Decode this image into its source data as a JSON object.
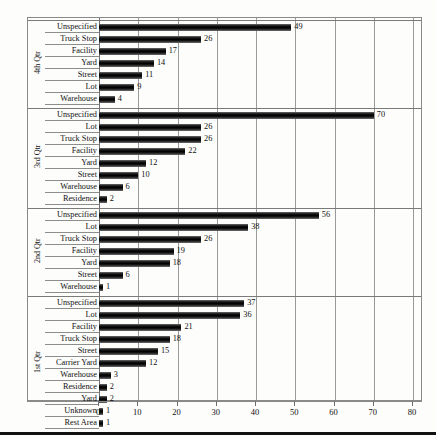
{
  "chart_data": {
    "type": "bar",
    "orientation": "horizontal",
    "title": "",
    "subtitle": "",
    "xlabel": "",
    "ylabel": "",
    "xlim": [
      0,
      80
    ],
    "xticks": [
      0,
      10,
      20,
      30,
      40,
      50,
      60,
      70,
      80
    ],
    "xtick_labels": [
      "0",
      "10",
      "20",
      "30",
      "40",
      "50",
      "60",
      "70",
      "80"
    ],
    "grid": true,
    "grid_axis": "x",
    "legend": false,
    "legend_position": "none",
    "bar_color": "#000000",
    "groups": [
      {
        "name": "4th Qtr",
        "categories": [
          "Unspecified",
          "Truck Stop",
          "Facility",
          "Yard",
          "Street",
          "Lot",
          "Warehouse"
        ],
        "values": [
          49,
          26,
          17,
          14,
          11,
          9,
          4
        ]
      },
      {
        "name": "3rd Qtr",
        "categories": [
          "Unspecified",
          "Lot",
          "Truck Stop",
          "Facility",
          "Yard",
          "Street",
          "Warehouse",
          "Residence"
        ],
        "values": [
          70,
          26,
          26,
          22,
          12,
          10,
          6,
          2
        ]
      },
      {
        "name": "2nd Qtr",
        "categories": [
          "Unspecified",
          "Lot",
          "Truck Stop",
          "Facility",
          "Yard",
          "Street",
          "Warehouse"
        ],
        "values": [
          56,
          38,
          26,
          19,
          18,
          6,
          1
        ]
      },
      {
        "name": "1st Qtr",
        "categories": [
          "Unspecified",
          "Lot",
          "Facility",
          "Truck Stop",
          "Street",
          "Carrier Yard",
          "Warehouse",
          "Residence",
          "Yard",
          "Unknown",
          "Rest Area"
        ],
        "values": [
          37,
          36,
          21,
          18,
          15,
          12,
          3,
          2,
          2,
          1,
          1
        ]
      }
    ]
  }
}
